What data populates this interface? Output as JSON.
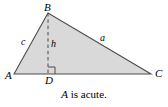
{
  "figure": {
    "type": "geometry-diagram",
    "background_color": "#ffffff",
    "fill_color": "#d9d9d9",
    "stroke_color": "#4d4d4d",
    "dash_color": "#4d4d4d",
    "text_color": "#000000",
    "vertices": [
      {
        "id": "B",
        "label": "B",
        "x": 48,
        "y": 13
      },
      {
        "id": "A",
        "label": "A",
        "x": 14,
        "y": 74
      },
      {
        "id": "C",
        "label": "C",
        "x": 151,
        "y": 74
      },
      {
        "id": "D",
        "label": "D",
        "x": 48,
        "y": 74
      }
    ],
    "sides": [
      {
        "id": "c",
        "label": "c",
        "from": "A",
        "to": "B"
      },
      {
        "id": "a",
        "label": "a",
        "from": "B",
        "to": "C"
      }
    ],
    "altitude": {
      "id": "h",
      "label": "h",
      "from": "B",
      "to": "D",
      "style": "dashed"
    },
    "right_angle": {
      "at": "D",
      "size": 7,
      "side": "right"
    },
    "caption": {
      "variable": "A",
      "text": " is acute."
    }
  }
}
